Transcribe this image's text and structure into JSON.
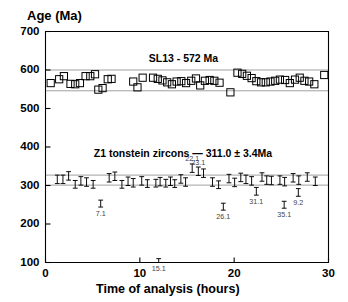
{
  "chart_data": {
    "type": "scatter",
    "title": "",
    "ylabel": "Age (Ma)",
    "xlabel": "Time of analysis (hours)",
    "xlim": [
      0,
      30
    ],
    "ylim": [
      100,
      700
    ],
    "xticks": [
      0,
      10,
      20,
      30
    ],
    "yticks": [
      100,
      200,
      300,
      400,
      500,
      600,
      700
    ],
    "grid": false,
    "legend": "none",
    "annotations": [
      {
        "name": "sl13-standard-label",
        "text": "SL13 - 572 Ma",
        "x": 14.6,
        "y": 628
      },
      {
        "name": "z1-tonstein-label",
        "text": "Z1 tonstein zircons — 311.0 ± 3.4Ma",
        "x": 14.6,
        "y": 381
      }
    ],
    "bands": [
      {
        "name": "sl13-reference-band",
        "label": "SL13 - 572 Ma",
        "ymin": 546,
        "ymax": 600
      },
      {
        "name": "z1-reference-band",
        "label": "Z1 tonstein zircons 311.0 ± 3.4 Ma",
        "ymin": 301,
        "ymax": 327
      }
    ],
    "series": [
      {
        "name": "SL13 standard zircon",
        "marker": "open-square",
        "color": "#000000",
        "points": [
          {
            "x": 0.55,
            "y": 566
          },
          {
            "x": 1.45,
            "y": 576
          },
          {
            "x": 1.95,
            "y": 584
          },
          {
            "x": 2.65,
            "y": 564
          },
          {
            "x": 3.15,
            "y": 563
          },
          {
            "x": 3.65,
            "y": 566
          },
          {
            "x": 4.25,
            "y": 584
          },
          {
            "x": 4.75,
            "y": 584
          },
          {
            "x": 5.25,
            "y": 589
          },
          {
            "x": 5.6,
            "y": 549
          },
          {
            "x": 6.05,
            "y": 553
          },
          {
            "x": 6.6,
            "y": 576
          },
          {
            "x": 7.0,
            "y": 577
          },
          {
            "x": 9.3,
            "y": 570
          },
          {
            "x": 9.75,
            "y": 555
          },
          {
            "x": 10.3,
            "y": 580
          },
          {
            "x": 11.4,
            "y": 580
          },
          {
            "x": 11.9,
            "y": 577
          },
          {
            "x": 12.4,
            "y": 573
          },
          {
            "x": 12.9,
            "y": 568
          },
          {
            "x": 13.4,
            "y": 563
          },
          {
            "x": 13.9,
            "y": 570
          },
          {
            "x": 14.4,
            "y": 571
          },
          {
            "x": 14.9,
            "y": 566
          },
          {
            "x": 15.45,
            "y": 572
          },
          {
            "x": 15.95,
            "y": 578
          },
          {
            "x": 16.4,
            "y": 560
          },
          {
            "x": 16.9,
            "y": 572
          },
          {
            "x": 17.4,
            "y": 574
          },
          {
            "x": 17.9,
            "y": 572
          },
          {
            "x": 18.45,
            "y": 567
          },
          {
            "x": 19.6,
            "y": 542
          },
          {
            "x": 20.35,
            "y": 593
          },
          {
            "x": 20.85,
            "y": 590
          },
          {
            "x": 21.35,
            "y": 585
          },
          {
            "x": 21.85,
            "y": 579
          },
          {
            "x": 22.35,
            "y": 571
          },
          {
            "x": 22.85,
            "y": 568
          },
          {
            "x": 23.35,
            "y": 568
          },
          {
            "x": 23.85,
            "y": 570
          },
          {
            "x": 24.35,
            "y": 572
          },
          {
            "x": 24.85,
            "y": 575
          },
          {
            "x": 25.4,
            "y": 574
          },
          {
            "x": 25.9,
            "y": 566
          },
          {
            "x": 26.45,
            "y": 575
          },
          {
            "x": 26.95,
            "y": 580
          },
          {
            "x": 27.45,
            "y": 572
          },
          {
            "x": 27.95,
            "y": 570
          },
          {
            "x": 28.5,
            "y": 563
          },
          {
            "x": 29.55,
            "y": 587
          }
        ]
      },
      {
        "name": "Z1 tonstein zircon analyses",
        "marker": "error-bar",
        "color": "#000000",
        "points": [
          {
            "x": 1.25,
            "y": 316,
            "err": 11
          },
          {
            "x": 1.85,
            "y": 316,
            "err": 11
          },
          {
            "x": 2.45,
            "y": 325,
            "err": 11
          },
          {
            "x": 3.15,
            "y": 303,
            "err": 10
          },
          {
            "x": 3.75,
            "y": 312,
            "err": 11
          },
          {
            "x": 4.35,
            "y": 309,
            "err": 11
          },
          {
            "x": 5.05,
            "y": 303,
            "err": 10
          },
          {
            "x": 5.85,
            "y": 253,
            "err": 9,
            "label": "7.1"
          },
          {
            "x": 6.75,
            "y": 320,
            "err": 11
          },
          {
            "x": 7.35,
            "y": 324,
            "err": 11
          },
          {
            "x": 8.1,
            "y": 303,
            "err": 10
          },
          {
            "x": 8.75,
            "y": 311,
            "err": 11
          },
          {
            "x": 9.3,
            "y": 307,
            "err": 11
          },
          {
            "x": 10.2,
            "y": 312,
            "err": 11
          },
          {
            "x": 10.8,
            "y": 305,
            "err": 10
          },
          {
            "x": 11.7,
            "y": 306,
            "err": 10
          },
          {
            "x": 12.15,
            "y": 310,
            "err": 11
          },
          {
            "x": 12.0,
            "y": 105,
            "err": 5,
            "label": "15.1"
          },
          {
            "x": 12.75,
            "y": 306,
            "err": 10
          },
          {
            "x": 13.25,
            "y": 311,
            "err": 11
          },
          {
            "x": 13.7,
            "y": 305,
            "err": 10
          },
          {
            "x": 14.35,
            "y": 317,
            "err": 11
          },
          {
            "x": 14.85,
            "y": 309,
            "err": 11
          },
          {
            "x": 15.55,
            "y": 345,
            "err": 11,
            "label": "22.1"
          },
          {
            "x": 16.2,
            "y": 337,
            "err": 11,
            "label": "23.1"
          },
          {
            "x": 16.75,
            "y": 332,
            "err": 11
          },
          {
            "x": 17.7,
            "y": 309,
            "err": 11
          },
          {
            "x": 18.35,
            "y": 302,
            "err": 10
          },
          {
            "x": 18.85,
            "y": 245,
            "err": 9,
            "label": "26.1"
          },
          {
            "x": 19.45,
            "y": 318,
            "err": 11
          },
          {
            "x": 20.05,
            "y": 308,
            "err": 11
          },
          {
            "x": 20.7,
            "y": 321,
            "err": 11
          },
          {
            "x": 21.25,
            "y": 316,
            "err": 11
          },
          {
            "x": 21.85,
            "y": 312,
            "err": 11
          },
          {
            "x": 22.35,
            "y": 285,
            "err": 10,
            "label": "31.1"
          },
          {
            "x": 22.95,
            "y": 322,
            "err": 11
          },
          {
            "x": 23.45,
            "y": 314,
            "err": 11
          },
          {
            "x": 23.95,
            "y": 313,
            "err": 11
          },
          {
            "x": 24.85,
            "y": 314,
            "err": 11
          },
          {
            "x": 25.35,
            "y": 310,
            "err": 11
          },
          {
            "x": 25.3,
            "y": 250,
            "err": 9,
            "label": "35.1"
          },
          {
            "x": 26.25,
            "y": 320,
            "err": 11
          },
          {
            "x": 26.85,
            "y": 314,
            "err": 11
          },
          {
            "x": 26.8,
            "y": 282,
            "err": 10,
            "label": "9.2"
          },
          {
            "x": 27.75,
            "y": 322,
            "err": 11
          },
          {
            "x": 28.6,
            "y": 311,
            "err": 11
          }
        ]
      }
    ]
  }
}
